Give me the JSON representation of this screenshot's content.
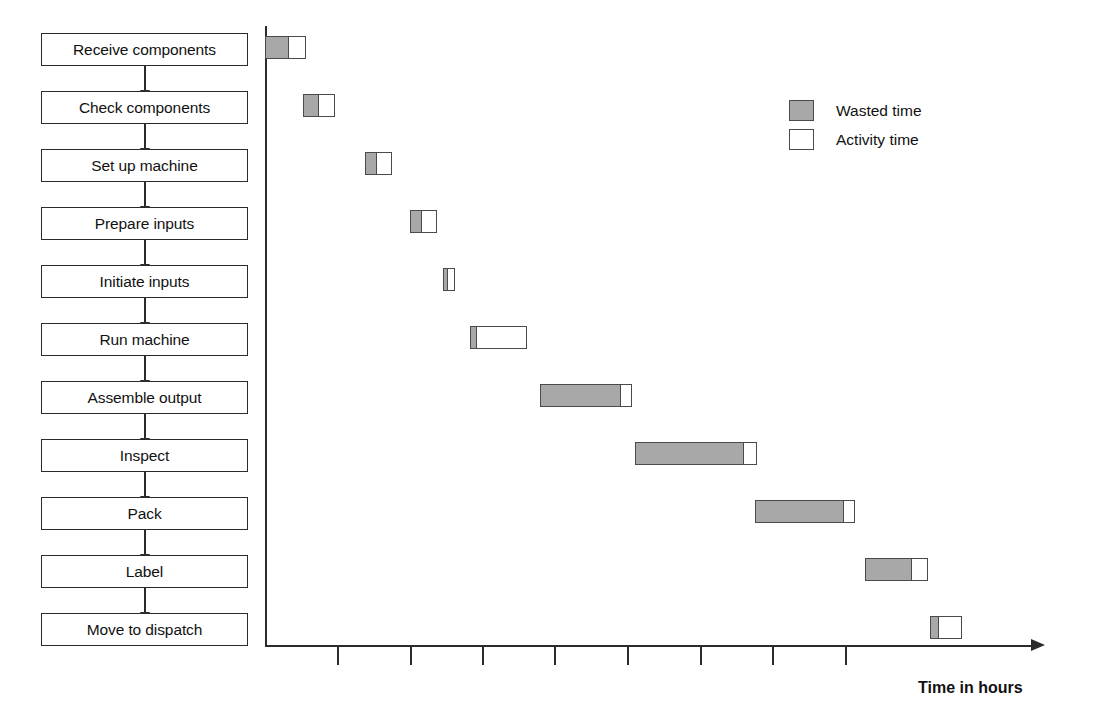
{
  "chart_data": {
    "type": "bar",
    "subtype": "gantt",
    "title": "",
    "xlabel": "Time in hours",
    "ylabel": "",
    "grid": false,
    "legend_position": "top-right",
    "axis": {
      "x_origin_px": 265,
      "x_end_px": 1035,
      "tick_count": 8,
      "tick_positions_px": [
        337,
        410,
        482,
        554,
        627,
        700,
        772,
        845
      ],
      "tick_labels": [
        "",
        "",
        "",
        "",
        "",
        "",
        "",
        ""
      ],
      "tick_spacing_px": 72.5,
      "units_per_tick": 1
    },
    "legend": [
      {
        "key": "wasted",
        "label": "Wasted time",
        "color": "#a8a8a8"
      },
      {
        "key": "activity",
        "label": "Activity time",
        "color": "#ffffff"
      }
    ],
    "categories": [
      "Receive components",
      "Check components",
      "Set up machine",
      "Prepare inputs",
      "Initiate inputs",
      "Run machine",
      "Assemble output",
      "Inspect",
      "Pack",
      "Label",
      "Move to dispatch"
    ],
    "series": [
      {
        "name": "Wasted time",
        "values_px": [
          25,
          17,
          13,
          13,
          6,
          8,
          82,
          110,
          90,
          48,
          10
        ]
      },
      {
        "name": "Activity time",
        "values_px": [
          16,
          15,
          14,
          14,
          6,
          49,
          10,
          12,
          10,
          15,
          22
        ]
      }
    ],
    "bars": [
      {
        "task": "Receive components",
        "start_px": 265,
        "wasted_px": 25,
        "activity_px": 16,
        "top_px": 36
      },
      {
        "task": "Check components",
        "start_px": 303,
        "wasted_px": 17,
        "activity_px": 15,
        "top_px": 94
      },
      {
        "task": "Set up machine",
        "start_px": 365,
        "wasted_px": 13,
        "activity_px": 14,
        "top_px": 152
      },
      {
        "task": "Prepare inputs",
        "start_px": 410,
        "wasted_px": 13,
        "activity_px": 14,
        "top_px": 210
      },
      {
        "task": "Initiate inputs",
        "start_px": 443,
        "wasted_px": 6,
        "activity_px": 6,
        "top_px": 268
      },
      {
        "task": "Run machine",
        "start_px": 470,
        "wasted_px": 8,
        "activity_px": 49,
        "top_px": 326
      },
      {
        "task": "Assemble output",
        "start_px": 540,
        "wasted_px": 82,
        "activity_px": 10,
        "top_px": 384
      },
      {
        "task": "Inspect",
        "start_px": 635,
        "wasted_px": 110,
        "activity_px": 12,
        "top_px": 442
      },
      {
        "task": "Pack",
        "start_px": 755,
        "wasted_px": 90,
        "activity_px": 10,
        "top_px": 500
      },
      {
        "task": "Label",
        "start_px": 865,
        "wasted_px": 48,
        "activity_px": 15,
        "top_px": 558
      },
      {
        "task": "Move to dispatch",
        "start_px": 930,
        "wasted_px": 10,
        "activity_px": 22,
        "top_px": 616
      }
    ]
  },
  "flow": {
    "steps": [
      {
        "label": "Receive components"
      },
      {
        "label": "Check components"
      },
      {
        "label": "Set up machine"
      },
      {
        "label": "Prepare inputs"
      },
      {
        "label": "Initiate inputs"
      },
      {
        "label": "Run machine"
      },
      {
        "label": "Assemble output"
      },
      {
        "label": "Inspect"
      },
      {
        "label": "Pack"
      },
      {
        "label": "Label"
      },
      {
        "label": "Move to dispatch"
      }
    ]
  }
}
